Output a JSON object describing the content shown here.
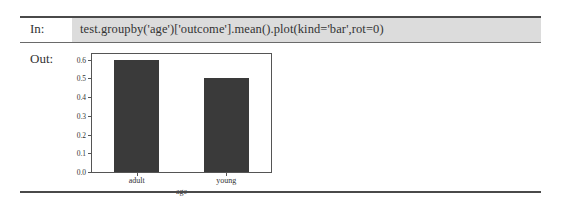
{
  "cell": {
    "input_label": "In:",
    "code": "test.groupby('age')['outcome'].mean().plot(kind='bar',rot=0)",
    "output_label": "Out:"
  },
  "colors": {
    "input_background": "#dcdcdc",
    "bar_fill": "#3a3a3a",
    "rule": "#4a4a4a"
  },
  "chart_data": {
    "type": "bar",
    "title": "",
    "categories": [
      "adult",
      "young"
    ],
    "values": [
      0.6,
      0.5
    ],
    "xlabel": "age",
    "ylabel": "",
    "ylim": [
      0.0,
      0.63
    ],
    "yticks": [
      "0.0",
      "0.1",
      "0.2",
      "0.3",
      "0.4",
      "0.5",
      "0.6"
    ],
    "grid": false,
    "legend": null
  }
}
